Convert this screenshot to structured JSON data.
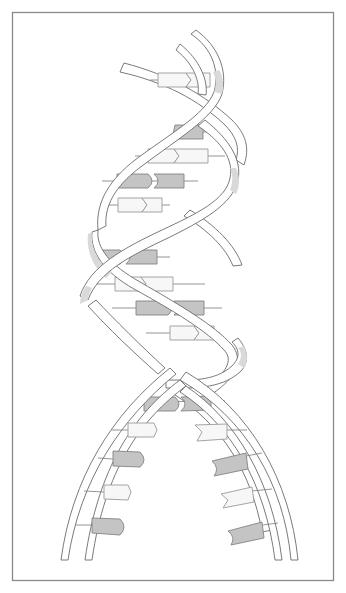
{
  "figure": {
    "title": "",
    "colors": {
      "frame": "#8a8a8a",
      "strand_outline": "#6b6b6b",
      "strand_shade": "#d9d9d9",
      "base_dark": "#c4c4c4",
      "base_light": "#f7f7f7",
      "background": "#ffffff"
    },
    "base_pairs": [
      {
        "y": 80,
        "left": "light",
        "right": "light",
        "shape": "chevron"
      },
      {
        "y": 132,
        "left": "dark",
        "right": "dark",
        "shape": "round"
      },
      {
        "y": 156,
        "left": "light",
        "right": "light",
        "shape": "chevron"
      },
      {
        "y": 181,
        "left": "dark",
        "right": "dark",
        "shape": "round"
      },
      {
        "y": 205,
        "left": "light",
        "right": "light",
        "shape": "chevron"
      },
      {
        "y": 257,
        "left": "dark",
        "right": "dark",
        "shape": "round"
      },
      {
        "y": 284,
        "left": "light",
        "right": "light",
        "shape": "chevron"
      },
      {
        "y": 308,
        "left": "dark",
        "right": "dark",
        "shape": "round"
      },
      {
        "y": 333,
        "left": "light",
        "right": "light",
        "shape": "chevron"
      },
      {
        "y": 404,
        "left": "dark",
        "right": "dark",
        "shape": "round"
      }
    ],
    "unpaired_bases_left": [
      "light-chevron",
      "dark-round",
      "light-chevron",
      "dark-round"
    ],
    "unpaired_bases_right": [
      "light-notch",
      "dark-cup",
      "light-notch",
      "dark-cup"
    ]
  }
}
